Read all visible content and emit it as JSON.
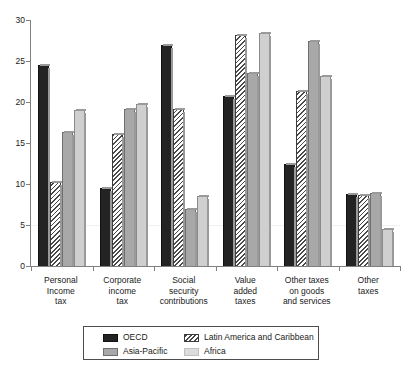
{
  "chart_data": {
    "type": "bar",
    "title": "",
    "subtitle": "",
    "xlabel": "",
    "ylabel": "",
    "ylim": [
      0,
      30
    ],
    "yticks": [
      0,
      5,
      10,
      15,
      20,
      25,
      30
    ],
    "ytick_labels": [
      "0",
      "5",
      "10",
      "15",
      "20",
      "25",
      "30"
    ],
    "grid": false,
    "legend_position": "bottom",
    "categories": [
      "Personal Income tax",
      "Corporate income tax",
      "Social security contributions",
      "Value added taxes",
      "Other taxes on goods and services",
      "Other taxes"
    ],
    "category_lines": [
      [
        "Personal",
        "Income",
        "tax"
      ],
      [
        "Corporate",
        "income",
        "tax"
      ],
      [
        "Social",
        "security",
        "contributions"
      ],
      [
        "Value",
        "added",
        "taxes"
      ],
      [
        "Other taxes",
        "on goods",
        "and services"
      ],
      [
        "Other",
        "taxes"
      ]
    ],
    "series": [
      {
        "name": "OECD",
        "color": "#232323",
        "pattern": "solid-dark",
        "values": [
          24.5,
          9.5,
          27.0,
          20.7,
          12.4,
          8.8
        ]
      },
      {
        "name": "Latin America and Caribbean",
        "color": "#4a4a4a",
        "pattern": "diagonal-hatch",
        "values": [
          10.2,
          16.1,
          19.1,
          28.2,
          21.4,
          8.6
        ]
      },
      {
        "name": "Asia-Pacific",
        "color": "#a8a8a8",
        "pattern": "solid-mid-gray",
        "values": [
          16.4,
          19.2,
          7.0,
          23.5,
          27.5,
          8.9
        ]
      },
      {
        "name": "Africa",
        "color": "#cfcfcf",
        "pattern": "solid-light-gray",
        "values": [
          19.0,
          19.8,
          8.5,
          28.4,
          23.2,
          4.5
        ]
      }
    ]
  }
}
